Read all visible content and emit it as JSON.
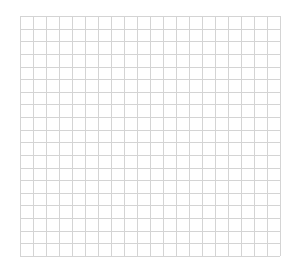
{
  "grid": {
    "columns": 20,
    "rows": 19,
    "line_color": "#d4d4d4",
    "background": "#ffffff"
  }
}
